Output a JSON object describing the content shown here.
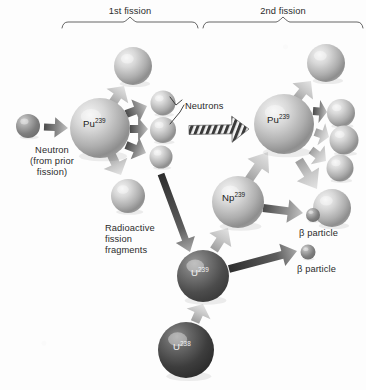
{
  "figure": {
    "background_color": "#fdfdfd",
    "text_color": "#2b2b2b"
  },
  "brackets": [
    {
      "name": "first-fission",
      "label": "1st fission",
      "x": 62,
      "y": 22,
      "width": 136,
      "label_x": 130,
      "label_y": 6
    },
    {
      "name": "second-fission",
      "label": "2nd fission",
      "x": 203,
      "y": 22,
      "width": 160,
      "label_x": 283,
      "label_y": 6
    }
  ],
  "labels": [
    {
      "name": "neutron-source-label",
      "text": "Neutron\n(from prior\nfission)",
      "x": 30,
      "y": 145,
      "align": "center"
    },
    {
      "name": "neutrons-label",
      "text": "Neutrons",
      "x": 185,
      "y": 101,
      "align": "left"
    },
    {
      "name": "fission-fragments-label",
      "text": "Radioactive\nfission\nfragments",
      "x": 105,
      "y": 223,
      "align": "left"
    },
    {
      "name": "beta-particle-label-1",
      "text": "β particle",
      "x": 299,
      "y": 228,
      "align": "left"
    },
    {
      "name": "beta-particle-label-2",
      "text": "β particle",
      "x": 297,
      "y": 264,
      "align": "left"
    }
  ],
  "spheres": [
    {
      "name": "incoming-neutron",
      "cx": 28,
      "cy": 126,
      "r": 12,
      "tone": "mid",
      "label": ""
    },
    {
      "name": "pu239-first",
      "cx": 100,
      "cy": 128,
      "r": 30,
      "tone": "light",
      "label": "Pu",
      "sup": "239",
      "label_dx": -17,
      "label_dy": -5
    },
    {
      "name": "fragment-top-left",
      "cx": 133,
      "cy": 66,
      "r": 19,
      "tone": "light",
      "label": ""
    },
    {
      "name": "neutron-a",
      "cx": 163,
      "cy": 103,
      "r": 12.5,
      "tone": "light",
      "label": ""
    },
    {
      "name": "neutron-b",
      "cx": 163,
      "cy": 130,
      "r": 13,
      "tone": "light",
      "label": ""
    },
    {
      "name": "neutron-c",
      "cx": 161,
      "cy": 157,
      "r": 11.5,
      "tone": "light",
      "label": ""
    },
    {
      "name": "fragment-bottom-left",
      "cx": 128,
      "cy": 196,
      "r": 17,
      "tone": "light",
      "label": ""
    },
    {
      "name": "pu239-second",
      "cx": 284,
      "cy": 124,
      "r": 30,
      "tone": "light",
      "label": "Pu",
      "sup": "239",
      "label_dx": -17,
      "label_dy": -5
    },
    {
      "name": "fragment-r1",
      "cx": 326,
      "cy": 63,
      "r": 19,
      "tone": "light",
      "label": ""
    },
    {
      "name": "fragment-r2",
      "cx": 341,
      "cy": 113,
      "r": 14,
      "tone": "light",
      "label": ""
    },
    {
      "name": "fragment-r3",
      "cx": 344,
      "cy": 140,
      "r": 14.5,
      "tone": "light",
      "label": ""
    },
    {
      "name": "fragment-r4",
      "cx": 340,
      "cy": 168,
      "r": 13.5,
      "tone": "light",
      "label": ""
    },
    {
      "name": "fragment-r5",
      "cx": 332,
      "cy": 208,
      "r": 19,
      "tone": "light",
      "label": ""
    },
    {
      "name": "np239",
      "cx": 238,
      "cy": 202,
      "r": 26,
      "tone": "light",
      "label": "Np",
      "sup": "239",
      "label_dx": -16,
      "label_dy": -5
    },
    {
      "name": "beta-particle-1",
      "cx": 313,
      "cy": 215,
      "r": 7,
      "tone": "mid",
      "label": ""
    },
    {
      "name": "beta-particle-2",
      "cx": 308,
      "cy": 252,
      "r": 7.5,
      "tone": "mid",
      "label": ""
    },
    {
      "name": "u239",
      "cx": 203,
      "cy": 276,
      "r": 26,
      "tone": "dark",
      "label": "U",
      "sup": "239",
      "label_dx": -12,
      "label_dy": -4
    },
    {
      "name": "u238",
      "cx": 186,
      "cy": 350,
      "r": 28,
      "tone": "darker",
      "label": "U",
      "sup": "238",
      "label_dx": -13,
      "label_dy": -4
    }
  ],
  "arrows": [
    {
      "name": "arrow-neutron-to-pu1",
      "x1": 44,
      "y1": 127,
      "x2": 68,
      "y2": 128,
      "tone": "dark",
      "w": 7
    },
    {
      "name": "arrow-pu1-to-fragment-top",
      "x1": 112,
      "y1": 104,
      "x2": 124,
      "y2": 86,
      "tone": "light",
      "w": 9
    },
    {
      "name": "arrow-pu1-to-neutron-a",
      "x1": 126,
      "y1": 114,
      "x2": 147,
      "y2": 106,
      "tone": "dark",
      "w": 8
    },
    {
      "name": "arrow-pu1-to-neutron-b",
      "x1": 130,
      "y1": 129,
      "x2": 148,
      "y2": 129,
      "tone": "dark",
      "w": 8
    },
    {
      "name": "arrow-pu1-to-neutron-c",
      "x1": 126,
      "y1": 145,
      "x2": 146,
      "y2": 153,
      "tone": "dark",
      "w": 8
    },
    {
      "name": "arrow-pu1-to-fragment-bot",
      "x1": 111,
      "y1": 154,
      "x2": 121,
      "y2": 175,
      "tone": "light",
      "w": 9
    },
    {
      "name": "arrow-chain-hatched",
      "x1": 189,
      "y1": 130,
      "x2": 249,
      "y2": 129,
      "tone": "hatch",
      "w": 9
    },
    {
      "name": "arrow-neutron-to-u239",
      "x1": 161,
      "y1": 174,
      "x2": 190,
      "y2": 252,
      "tone": "darkest",
      "w": 7
    },
    {
      "name": "arrow-pu2-to-r1",
      "x1": 296,
      "y1": 100,
      "x2": 311,
      "y2": 81,
      "tone": "light",
      "w": 9
    },
    {
      "name": "arrow-pu2-to-r2",
      "x1": 313,
      "y1": 111,
      "x2": 327,
      "y2": 112,
      "tone": "dark",
      "w": 8
    },
    {
      "name": "arrow-pu2-to-r3",
      "x1": 315,
      "y1": 132,
      "x2": 329,
      "y2": 137,
      "tone": "light",
      "w": 8
    },
    {
      "name": "arrow-pu2-to-r4",
      "x1": 311,
      "y1": 150,
      "x2": 326,
      "y2": 161,
      "tone": "light",
      "w": 8
    },
    {
      "name": "arrow-pu2-to-r5",
      "x1": 299,
      "y1": 160,
      "x2": 317,
      "y2": 189,
      "tone": "light",
      "w": 9
    },
    {
      "name": "arrow-np239-to-pu2",
      "x1": 248,
      "y1": 181,
      "x2": 268,
      "y2": 152,
      "tone": "light",
      "w": 9
    },
    {
      "name": "arrow-u239-to-np239",
      "x1": 214,
      "y1": 250,
      "x2": 228,
      "y2": 228,
      "tone": "light",
      "w": 9
    },
    {
      "name": "arrow-np239-to-beta1",
      "x1": 263,
      "y1": 208,
      "x2": 303,
      "y2": 213,
      "tone": "dark",
      "w": 8
    },
    {
      "name": "arrow-u239-to-beta2",
      "x1": 229,
      "y1": 269,
      "x2": 297,
      "y2": 251,
      "tone": "darkest",
      "w": 8
    },
    {
      "name": "arrow-u238-to-u239",
      "x1": 195,
      "y1": 322,
      "x2": 203,
      "y2": 304,
      "tone": "light",
      "w": 9
    }
  ],
  "leader_lines": [
    {
      "name": "leader-neutrons-a",
      "points": "182,100 176,105 170,97"
    },
    {
      "name": "leader-neutrons-b",
      "points": "184,105 180,112 170,124"
    }
  ]
}
